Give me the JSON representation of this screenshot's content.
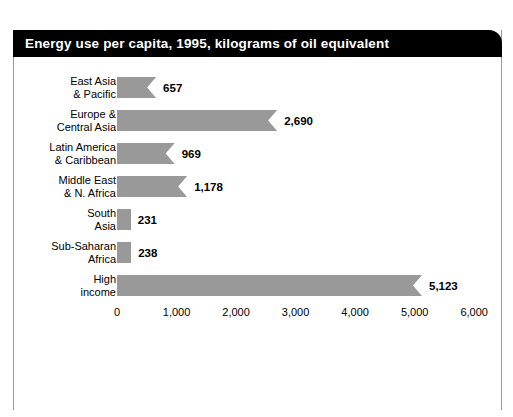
{
  "title": "Energy use per capita, 1995, kilograms of oil equivalent",
  "colors": {
    "title_bar_background": "#000000",
    "title_text": "#ffffff",
    "bar_fill": "#999999",
    "page_background": "#ffffff",
    "frame_border": "#9a9a9a",
    "text": "#000000"
  },
  "chart_data": {
    "type": "bar",
    "orientation": "horizontal",
    "title": "Energy use per capita, 1995, kilograms of oil equivalent",
    "xlabel": "",
    "ylabel": "",
    "categories": [
      "East Asia\n& Pacific",
      "Europe &\nCentral Asia",
      "Latin America\n& Caribbean",
      "Middle East\n& N. Africa",
      "South\nAsia",
      "Sub-Saharan\nAfrica",
      "High\nincome"
    ],
    "values": [
      657,
      2690,
      969,
      1178,
      231,
      238,
      5123
    ],
    "value_labels": [
      "657",
      "2,690",
      "969",
      "1,178",
      "231",
      "238",
      "5,123"
    ],
    "xlim": [
      0,
      6000
    ],
    "xticks": [
      0,
      1000,
      2000,
      3000,
      4000,
      5000,
      6000
    ],
    "xtick_labels": [
      "0",
      "1,000",
      "2,000",
      "3,000",
      "4,000",
      "5,000",
      "6,000"
    ],
    "grid": false,
    "legend": false,
    "bar_style": "chevron-notched-right-edge",
    "series": [
      {
        "name": "Energy use per capita (kg of oil equivalent)",
        "values": [
          657,
          2690,
          969,
          1178,
          231,
          238,
          5123
        ]
      }
    ]
  }
}
